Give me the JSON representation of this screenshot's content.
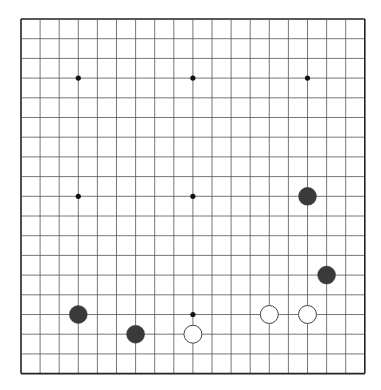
{
  "game": "go",
  "board": {
    "size": 19,
    "origin": {
      "x": 21,
      "y": 19
    },
    "spacing": {
      "x": 19.1,
      "y": 19.7
    },
    "line_color": "#555555",
    "border_color": "#222222",
    "background": "#ffffff"
  },
  "hoshi": [
    {
      "col": 3,
      "row": 3
    },
    {
      "col": 9,
      "row": 3
    },
    {
      "col": 15,
      "row": 3
    },
    {
      "col": 3,
      "row": 9
    },
    {
      "col": 9,
      "row": 9
    },
    {
      "col": 15,
      "row": 9
    },
    {
      "col": 3,
      "row": 15
    },
    {
      "col": 9,
      "row": 15
    },
    {
      "col": 15,
      "row": 15
    }
  ],
  "stones": [
    {
      "color": "black",
      "col": 15,
      "row": 9
    },
    {
      "color": "black",
      "col": 16,
      "row": 13
    },
    {
      "color": "black",
      "col": 3,
      "row": 15
    },
    {
      "color": "black",
      "col": 6,
      "row": 16
    },
    {
      "color": "white",
      "col": 9,
      "row": 16
    },
    {
      "color": "white",
      "col": 13,
      "row": 15
    },
    {
      "color": "white",
      "col": 15,
      "row": 15
    }
  ],
  "colors": {
    "black_stone": "#3a3a3a",
    "white_stone": "#ffffff",
    "white_stone_border": "#444444"
  }
}
